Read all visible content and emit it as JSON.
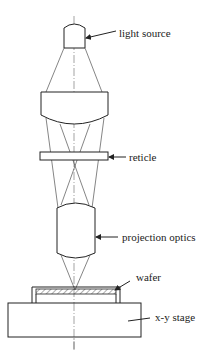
{
  "diagram": {
    "labels": {
      "light_source": "light source",
      "reticle": "reticle",
      "projection_optics": "projection optics",
      "wafer": "wafer",
      "xy_stage": "x-y stage"
    },
    "components": [
      {
        "id": "light_source",
        "label": "light source"
      },
      {
        "id": "condenser_lens",
        "label": ""
      },
      {
        "id": "reticle",
        "label": "reticle"
      },
      {
        "id": "projection_optics",
        "label": "projection optics"
      },
      {
        "id": "wafer",
        "label": "wafer"
      },
      {
        "id": "xy_stage",
        "label": "x-y stage"
      }
    ],
    "colors": {
      "line": "#222222",
      "background": "#ffffff"
    }
  }
}
